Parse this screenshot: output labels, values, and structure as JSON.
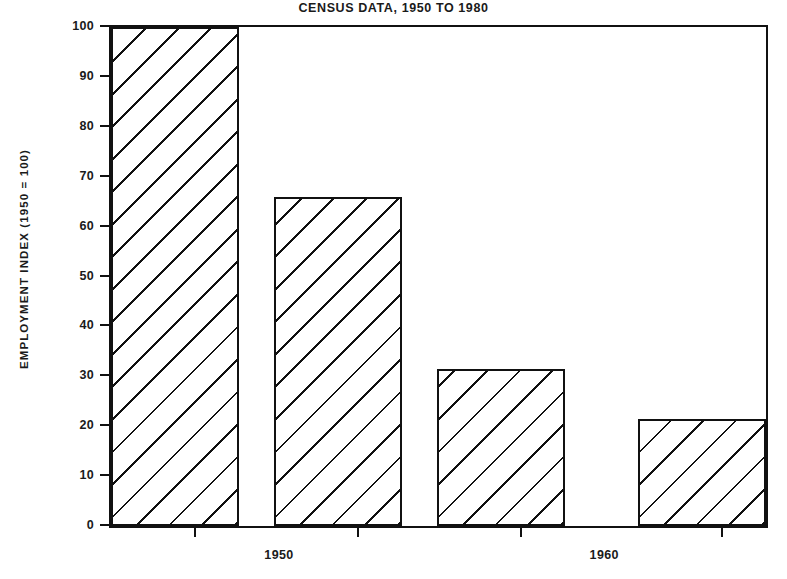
{
  "chart_data": {
    "type": "bar",
    "title": "CENSUS DATA, 1950 TO 1980",
    "xlabel": "",
    "ylabel": "EMPLOYMENT INDEX (1950 = 100)",
    "categories": [
      "1950",
      "1960",
      "1970",
      "1980"
    ],
    "values": [
      100,
      66,
      31.5,
      21.5
    ],
    "ylim": [
      0,
      100
    ],
    "xlim": [
      1945,
      1985
    ],
    "y_ticks": [
      0,
      10,
      20,
      30,
      40,
      50,
      60,
      70,
      80,
      90,
      100
    ],
    "y_tick_labels": [
      "0",
      "10",
      "20",
      "30",
      "40",
      "50",
      "60",
      "70",
      "80",
      "90",
      "100"
    ],
    "x_tick_labels": [
      "1950",
      "1960",
      "1970",
      "1980"
    ],
    "grid": false,
    "legend": null,
    "bar_fill": "#ffffff",
    "bar_edge_color": "#111111",
    "bar_hatch": "diagonal-45",
    "background": "#ffffff",
    "text_color": "#111111"
  }
}
